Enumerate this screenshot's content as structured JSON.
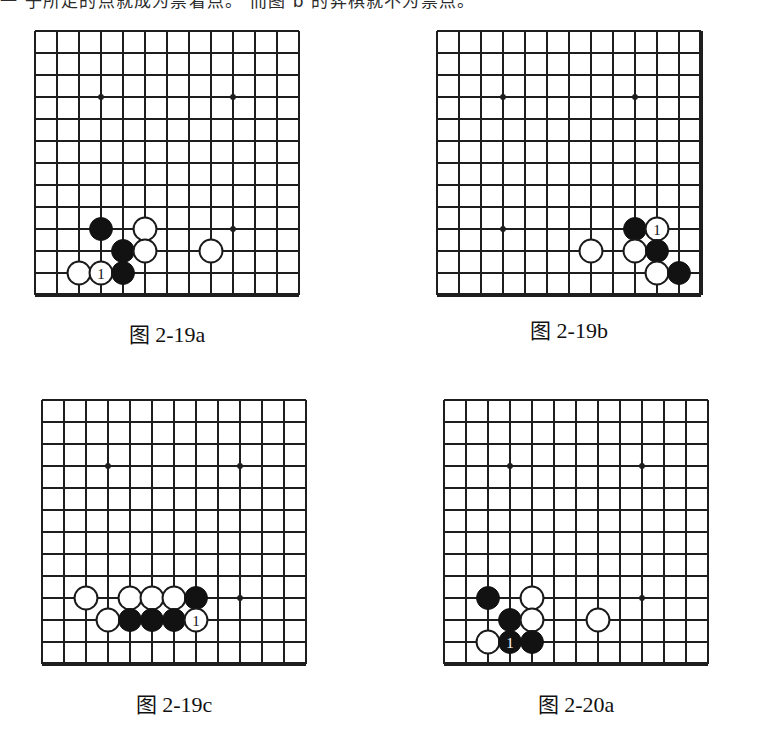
{
  "page": {
    "width": 760,
    "height": 750,
    "background": "#ffffff",
    "ink": "#1a1a1a",
    "top_text": "一 子所走的点就成为禁着点。 而图 b 的弈棋就不为禁点。"
  },
  "figures": [
    {
      "id": "fig-2-19a",
      "caption": "图 2-19a",
      "caption_cn": "图",
      "caption_num": "2-19a",
      "x": 35,
      "y": 31,
      "cols": 12,
      "rows": 12,
      "cell": 22,
      "edges": {
        "left": false,
        "top": false,
        "right": false,
        "bottom": true
      },
      "star_points": [
        [
          3,
          3
        ],
        [
          9,
          3
        ],
        [
          9,
          9
        ]
      ],
      "stones": [
        {
          "col": 3,
          "row": 9,
          "color": "black",
          "label": ""
        },
        {
          "col": 5,
          "row": 9,
          "color": "white",
          "label": ""
        },
        {
          "col": 4,
          "row": 10,
          "color": "black",
          "label": ""
        },
        {
          "col": 5,
          "row": 10,
          "color": "white",
          "label": ""
        },
        {
          "col": 8,
          "row": 10,
          "color": "white",
          "label": ""
        },
        {
          "col": 2,
          "row": 11,
          "color": "white",
          "label": ""
        },
        {
          "col": 3,
          "row": 11,
          "color": "white",
          "label": "1"
        },
        {
          "col": 4,
          "row": 11,
          "color": "black",
          "label": ""
        }
      ]
    },
    {
      "id": "fig-2-19b",
      "caption": "图 2-19b",
      "caption_cn": "图",
      "caption_num": "2-19b",
      "x": 437,
      "y": 31,
      "cols": 12,
      "rows": 12,
      "cell": 22,
      "edges": {
        "left": false,
        "top": false,
        "right": true,
        "bottom": true
      },
      "star_points": [
        [
          3,
          3
        ],
        [
          9,
          3
        ],
        [
          3,
          9
        ]
      ],
      "stones": [
        {
          "col": 9,
          "row": 9,
          "color": "black",
          "label": ""
        },
        {
          "col": 10,
          "row": 9,
          "color": "white",
          "label": "1"
        },
        {
          "col": 7,
          "row": 10,
          "color": "white",
          "label": ""
        },
        {
          "col": 9,
          "row": 10,
          "color": "white",
          "label": ""
        },
        {
          "col": 10,
          "row": 10,
          "color": "black",
          "label": ""
        },
        {
          "col": 10,
          "row": 11,
          "color": "white",
          "label": ""
        },
        {
          "col": 11,
          "row": 11,
          "color": "black",
          "label": ""
        }
      ]
    },
    {
      "id": "fig-2-19c",
      "caption": "图 2-19c",
      "caption_cn": "图",
      "caption_num": "2-19c",
      "x": 42,
      "y": 400,
      "cols": 12,
      "rows": 12,
      "cell": 22,
      "edges": {
        "left": false,
        "top": false,
        "right": false,
        "bottom": true
      },
      "star_points": [
        [
          3,
          3
        ],
        [
          9,
          3
        ],
        [
          9,
          9
        ]
      ],
      "stones": [
        {
          "col": 2,
          "row": 9,
          "color": "white",
          "label": ""
        },
        {
          "col": 4,
          "row": 9,
          "color": "white",
          "label": ""
        },
        {
          "col": 5,
          "row": 9,
          "color": "white",
          "label": ""
        },
        {
          "col": 6,
          "row": 9,
          "color": "white",
          "label": ""
        },
        {
          "col": 7,
          "row": 9,
          "color": "black",
          "label": ""
        },
        {
          "col": 3,
          "row": 10,
          "color": "white",
          "label": ""
        },
        {
          "col": 4,
          "row": 10,
          "color": "black",
          "label": ""
        },
        {
          "col": 5,
          "row": 10,
          "color": "black",
          "label": ""
        },
        {
          "col": 6,
          "row": 10,
          "color": "black",
          "label": ""
        },
        {
          "col": 7,
          "row": 10,
          "color": "white",
          "label": "1"
        }
      ]
    },
    {
      "id": "fig-2-20a",
      "caption": "图 2-20a",
      "caption_cn": "图",
      "caption_num": "2-20a",
      "x": 444,
      "y": 400,
      "cols": 12,
      "rows": 12,
      "cell": 22,
      "edges": {
        "left": false,
        "top": false,
        "right": false,
        "bottom": true
      },
      "star_points": [
        [
          3,
          3
        ],
        [
          9,
          3
        ],
        [
          9,
          9
        ]
      ],
      "stones": [
        {
          "col": 2,
          "row": 9,
          "color": "black",
          "label": ""
        },
        {
          "col": 4,
          "row": 9,
          "color": "white",
          "label": ""
        },
        {
          "col": 3,
          "row": 10,
          "color": "black",
          "label": ""
        },
        {
          "col": 4,
          "row": 10,
          "color": "white",
          "label": ""
        },
        {
          "col": 7,
          "row": 10,
          "color": "white",
          "label": ""
        },
        {
          "col": 2,
          "row": 11,
          "color": "white",
          "label": ""
        },
        {
          "col": 3,
          "row": 11,
          "color": "black",
          "label": "1"
        },
        {
          "col": 4,
          "row": 11,
          "color": "black",
          "label": ""
        }
      ]
    }
  ],
  "caption_positions": [
    {
      "x": 35,
      "y": 318,
      "w": 262
    },
    {
      "x": 437,
      "y": 314,
      "w": 262
    },
    {
      "x": 42,
      "y": 688,
      "w": 262
    },
    {
      "x": 444,
      "y": 688,
      "w": 262
    }
  ],
  "colors": {
    "line": "#1e1e1e",
    "black_stone": "#121212",
    "white_stone": "#ffffff",
    "white_stone_outline": "#1a1a1a",
    "paper": "#ffffff"
  }
}
